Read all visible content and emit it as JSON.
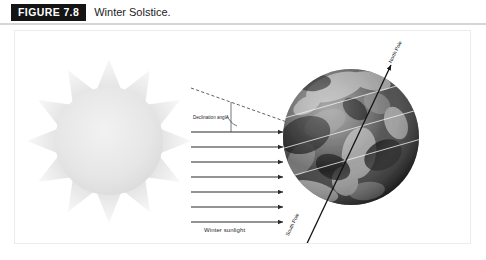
{
  "figure": {
    "badge_label": "FIGURE 7.8",
    "caption": "Winter Solstice.",
    "badge_bg": "#141414",
    "badge_fg": "#ffffff",
    "rule_color": "#d6d6d6",
    "panel_border": "#ececec"
  },
  "diagram": {
    "sun": {
      "name": "Sun",
      "body_color": "#e6e6e6",
      "ray_color": "#efefef",
      "ray_count": 12
    },
    "sunlight": {
      "label": "Winter sunlight",
      "arrow_count": 7,
      "arrow_color": "#2b2b2b"
    },
    "declination": {
      "label": "Declination angle",
      "line_style": "dashed",
      "line_color": "#333333",
      "arc_color": "#333333"
    },
    "earth": {
      "name": "Earth",
      "axis_color": "#111111",
      "latitude_line_color": "#f2f2f2",
      "poles": {
        "north": "North Pole",
        "south": "South Pole"
      },
      "latitude_lines": [
        "Tropic of Cancer",
        "Equator",
        "Tropic of Capricorn"
      ]
    }
  }
}
